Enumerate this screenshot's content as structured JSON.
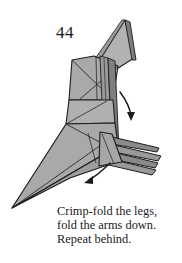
{
  "page": {
    "background_color": "#ffffff",
    "width": 182,
    "height": 263
  },
  "step": {
    "number": "44"
  },
  "caption": {
    "line1": "Crimp-fold the legs,",
    "line2": "fold the arms down.",
    "line3": "Repeat behind."
  },
  "diagram": {
    "paper_fill": "#a9a9a9",
    "paper_fill_light": "#bdbdbd",
    "paper_fill_dark": "#949494",
    "paper_fill_darker": "#7d7d7d",
    "edge_color": "#1d1d1d",
    "crease_color": "#2a2a2a",
    "dashed_fold_color": "#2a2a2a",
    "arrow_color": "#1a1a1a",
    "arrows": [
      {
        "name": "arms-fold-down-arrow",
        "direction": "down-right",
        "meaning": "fold the arms down"
      },
      {
        "name": "legs-crimp-fold-arrow",
        "direction": "down-left",
        "meaning": "crimp-fold the legs"
      }
    ],
    "fold_lines": [
      {
        "name": "valley-fold-dashed-line",
        "style": "dashed"
      }
    ]
  }
}
